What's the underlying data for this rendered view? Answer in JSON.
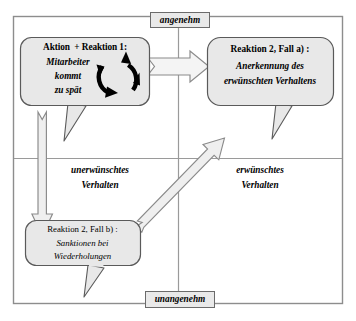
{
  "diagram": {
    "frame_color": "#7a7a7a",
    "box_fill": "#e8e8e8",
    "box_stroke": "#5a5a5a",
    "arrow_fill": "#efefef",
    "arrow_stroke": "#8a8a8a"
  },
  "axis": {
    "top_label": "angenehm",
    "bottom_label": "unangenehm"
  },
  "quadrants": {
    "left_label_line1": "unerwünschtes",
    "left_label_line2": "Verhalten",
    "right_label_line1": "erwünschtes",
    "right_label_line2": "Verhalten"
  },
  "callouts": [
    {
      "id": "aktion-reaktion-1",
      "heading": "Aktion  + Reaktion 1:",
      "lines": [
        "Mitarbeiter",
        "kommt",
        "zu spät"
      ],
      "icon": "circular-loop-icon"
    },
    {
      "id": "reaktion-2-fall-a",
      "heading": "Reaktion 2, Fall a) :",
      "lines": [
        "Anerkennung des",
        "erwünschten Verhaltens"
      ]
    },
    {
      "id": "reaktion-2-fall-b",
      "heading": "Reaktion 2, Fall b) :",
      "lines": [
        "Sanktionen bei",
        "Wiederholungen"
      ]
    }
  ],
  "arrows": [
    {
      "id": "arrow-horizontal-right",
      "from": "aktion-reaktion-1",
      "to": "reaktion-2-fall-a",
      "direction": "right"
    },
    {
      "id": "arrow-vertical-down",
      "from": "aktion-reaktion-1",
      "to": "reaktion-2-fall-b",
      "direction": "down"
    },
    {
      "id": "arrow-diagonal-up-right",
      "from": "reaktion-2-fall-b",
      "to": "reaktion-2-fall-a",
      "direction": "up-right"
    }
  ]
}
